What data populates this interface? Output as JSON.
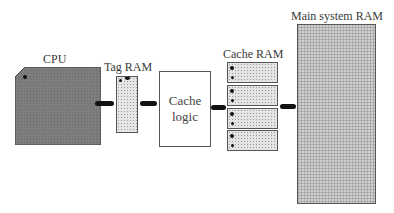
{
  "diagram": {
    "cpu": {
      "label": "CPU",
      "fill": "#7a7a7a"
    },
    "tag_ram": {
      "label": "Tag RAM"
    },
    "cache_logic": {
      "line1": "Cache",
      "line2": "logic"
    },
    "cache_ram": {
      "label": "Cache RAM",
      "chip_count": 4
    },
    "main_ram": {
      "label": "Main system RAM"
    }
  }
}
